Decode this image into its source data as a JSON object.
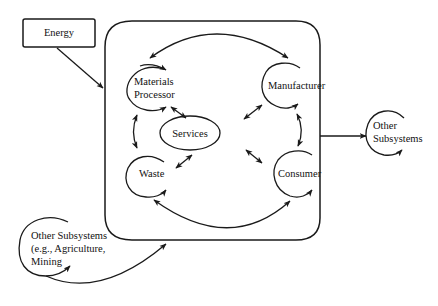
{
  "diagram": {
    "type": "system-flow-diagram",
    "colors": {
      "line": "#1a1a1a",
      "background": "#ffffff",
      "text": "#111111"
    },
    "energy_box": {
      "label": "Energy"
    },
    "system_nodes": {
      "materials_processor": {
        "line1": "Materials",
        "line2": "Processor"
      },
      "manufacturer": {
        "label": "Manufacturer"
      },
      "services": {
        "label": "Services"
      },
      "waste": {
        "label": "Waste"
      },
      "consumer": {
        "label": "Consumer"
      }
    },
    "other_subsystems_out": {
      "line1": "Other",
      "line2": "Subsystems"
    },
    "other_subsystems_in": {
      "line1": "Other Subsystems",
      "line2": "(e.g., Agriculture,",
      "line3": "Mining"
    },
    "edges": [
      {
        "from": "Energy",
        "to": "System boundary",
        "direction": "one-way"
      },
      {
        "from": "Materials Processor",
        "to": "Manufacturer",
        "direction": "one-way",
        "shape": "top arc"
      },
      {
        "from": "Materials Processor",
        "to": "Services",
        "direction": "two-way"
      },
      {
        "from": "Manufacturer",
        "to": "Services",
        "direction": "two-way"
      },
      {
        "from": "Waste",
        "to": "Services",
        "direction": "two-way"
      },
      {
        "from": "Consumer",
        "to": "Services",
        "direction": "two-way"
      },
      {
        "from": "Materials Processor",
        "to": "Waste",
        "direction": "two-way"
      },
      {
        "from": "Manufacturer",
        "to": "Consumer",
        "direction": "two-way"
      },
      {
        "from": "Consumer",
        "to": "Waste",
        "direction": "two-way",
        "shape": "bottom arc"
      },
      {
        "from": "System boundary",
        "to": "Other Subsystems",
        "direction": "one-way"
      },
      {
        "from": "Other Subsystems (e.g., Agriculture, Mining",
        "to": "System boundary",
        "direction": "one-way"
      }
    ]
  }
}
